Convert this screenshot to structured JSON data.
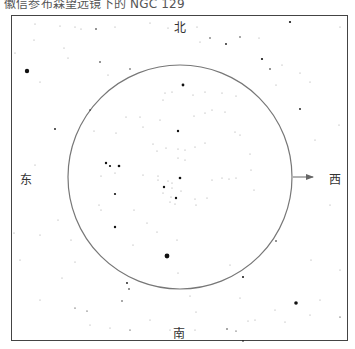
{
  "title": "徽信参布森望远镜下的 NGC 129",
  "directions": {
    "north": "北",
    "south": "南",
    "east": "东",
    "west": "西"
  },
  "field_circle": {
    "cx": 180,
    "cy": 177,
    "r": 112,
    "stroke": "#777777"
  },
  "motion_arrow": {
    "x1": 293,
    "y1": 177,
    "x2": 313,
    "y2": 177,
    "color": "#666666"
  },
  "colors": {
    "frame": "#444444",
    "star": "#111111",
    "faint_star": "#999999",
    "text": "#333333"
  },
  "stars": [
    {
      "x": 27,
      "y": 71,
      "r": 2.2
    },
    {
      "x": 183,
      "y": 85,
      "r": 1.4
    },
    {
      "x": 178,
      "y": 131,
      "r": 1.2
    },
    {
      "x": 106,
      "y": 163,
      "r": 1.2
    },
    {
      "x": 110,
      "y": 166,
      "r": 1.1
    },
    {
      "x": 119,
      "y": 166,
      "r": 1.3
    },
    {
      "x": 180,
      "y": 178,
      "r": 1.3
    },
    {
      "x": 164,
      "y": 187,
      "r": 1.2
    },
    {
      "x": 176,
      "y": 198,
      "r": 1.2
    },
    {
      "x": 115,
      "y": 194,
      "r": 1.1
    },
    {
      "x": 115,
      "y": 227,
      "r": 1.2
    },
    {
      "x": 167,
      "y": 256,
      "r": 2.4
    },
    {
      "x": 96,
      "y": 29,
      "r": 0.8
    },
    {
      "x": 290,
      "y": 22,
      "r": 1.1
    },
    {
      "x": 226,
      "y": 44,
      "r": 0.9
    },
    {
      "x": 262,
      "y": 59,
      "r": 1.1
    },
    {
      "x": 270,
      "y": 69,
      "r": 0.8
    },
    {
      "x": 300,
      "y": 109,
      "r": 0.9
    },
    {
      "x": 100,
      "y": 62,
      "r": 0.8
    },
    {
      "x": 55,
      "y": 129,
      "r": 0.9
    },
    {
      "x": 90,
      "y": 110,
      "r": 0.7
    },
    {
      "x": 130,
      "y": 69,
      "r": 0.7
    },
    {
      "x": 210,
      "y": 38,
      "r": 0.7
    },
    {
      "x": 240,
      "y": 37,
      "r": 0.7
    },
    {
      "x": 296,
      "y": 303,
      "r": 1.8
    },
    {
      "x": 243,
      "y": 277,
      "r": 1.0
    },
    {
      "x": 276,
      "y": 241,
      "r": 0.8
    },
    {
      "x": 127,
      "y": 283,
      "r": 0.9
    },
    {
      "x": 129,
      "y": 289,
      "r": 0.8
    },
    {
      "x": 122,
      "y": 301,
      "r": 0.7
    },
    {
      "x": 227,
      "y": 329,
      "r": 0.7
    },
    {
      "x": 243,
      "y": 341,
      "r": 0.8
    },
    {
      "x": 340,
      "y": 317,
      "r": 0.6
    },
    {
      "x": 75,
      "y": 308,
      "r": 0.6
    },
    {
      "x": 87,
      "y": 311,
      "r": 0.6
    },
    {
      "x": 236,
      "y": 331,
      "r": 0.6
    },
    {
      "x": 130,
      "y": 330,
      "r": 0.6
    }
  ],
  "faint_stars": [
    {
      "x": 35,
      "y": 24
    },
    {
      "x": 60,
      "y": 26
    },
    {
      "x": 75,
      "y": 27
    },
    {
      "x": 81,
      "y": 29
    },
    {
      "x": 115,
      "y": 27
    },
    {
      "x": 150,
      "y": 23
    },
    {
      "x": 168,
      "y": 28
    },
    {
      "x": 34,
      "y": 40
    },
    {
      "x": 15,
      "y": 53
    },
    {
      "x": 64,
      "y": 48
    },
    {
      "x": 68,
      "y": 58
    },
    {
      "x": 108,
      "y": 75
    },
    {
      "x": 40,
      "y": 82
    },
    {
      "x": 200,
      "y": 42
    },
    {
      "x": 197,
      "y": 27
    },
    {
      "x": 259,
      "y": 38
    },
    {
      "x": 282,
      "y": 65
    },
    {
      "x": 276,
      "y": 85
    },
    {
      "x": 300,
      "y": 73
    },
    {
      "x": 310,
      "y": 82
    },
    {
      "x": 340,
      "y": 27
    },
    {
      "x": 339,
      "y": 125
    },
    {
      "x": 315,
      "y": 140
    },
    {
      "x": 330,
      "y": 205
    },
    {
      "x": 311,
      "y": 260
    },
    {
      "x": 340,
      "y": 270
    },
    {
      "x": 320,
      "y": 300
    },
    {
      "x": 310,
      "y": 315
    },
    {
      "x": 275,
      "y": 310
    },
    {
      "x": 285,
      "y": 322
    },
    {
      "x": 40,
      "y": 235
    },
    {
      "x": 58,
      "y": 220
    },
    {
      "x": 71,
      "y": 240
    },
    {
      "x": 75,
      "y": 262
    },
    {
      "x": 62,
      "y": 278
    },
    {
      "x": 40,
      "y": 300
    },
    {
      "x": 90,
      "y": 325
    },
    {
      "x": 110,
      "y": 328
    },
    {
      "x": 150,
      "y": 320
    },
    {
      "x": 170,
      "y": 330
    },
    {
      "x": 240,
      "y": 298
    },
    {
      "x": 255,
      "y": 320
    },
    {
      "x": 195,
      "y": 330
    },
    {
      "x": 14,
      "y": 233
    },
    {
      "x": 22,
      "y": 180
    },
    {
      "x": 35,
      "y": 165
    },
    {
      "x": 20,
      "y": 260
    },
    {
      "x": 165,
      "y": 93
    },
    {
      "x": 172,
      "y": 92
    },
    {
      "x": 163,
      "y": 100
    },
    {
      "x": 193,
      "y": 95
    },
    {
      "x": 205,
      "y": 92
    },
    {
      "x": 222,
      "y": 93
    },
    {
      "x": 236,
      "y": 96
    },
    {
      "x": 212,
      "y": 110
    },
    {
      "x": 205,
      "y": 113
    },
    {
      "x": 225,
      "y": 112
    },
    {
      "x": 194,
      "y": 116
    },
    {
      "x": 126,
      "y": 117
    },
    {
      "x": 140,
      "y": 117
    },
    {
      "x": 143,
      "y": 127
    },
    {
      "x": 160,
      "y": 120
    },
    {
      "x": 94,
      "y": 131
    },
    {
      "x": 116,
      "y": 133
    },
    {
      "x": 235,
      "y": 132
    },
    {
      "x": 240,
      "y": 135
    },
    {
      "x": 153,
      "y": 144
    },
    {
      "x": 157,
      "y": 151
    },
    {
      "x": 166,
      "y": 148
    },
    {
      "x": 178,
      "y": 149
    },
    {
      "x": 185,
      "y": 150
    },
    {
      "x": 195,
      "y": 147
    },
    {
      "x": 205,
      "y": 143
    },
    {
      "x": 178,
      "y": 158
    },
    {
      "x": 185,
      "y": 160
    },
    {
      "x": 143,
      "y": 175
    },
    {
      "x": 158,
      "y": 176
    },
    {
      "x": 158,
      "y": 180
    },
    {
      "x": 168,
      "y": 181
    },
    {
      "x": 172,
      "y": 183
    },
    {
      "x": 172,
      "y": 188
    },
    {
      "x": 163,
      "y": 193
    },
    {
      "x": 171,
      "y": 197
    },
    {
      "x": 181,
      "y": 191
    },
    {
      "x": 170,
      "y": 202
    },
    {
      "x": 175,
      "y": 204
    },
    {
      "x": 195,
      "y": 199
    },
    {
      "x": 196,
      "y": 205
    },
    {
      "x": 207,
      "y": 198
    },
    {
      "x": 212,
      "y": 180
    },
    {
      "x": 222,
      "y": 178
    },
    {
      "x": 229,
      "y": 179
    },
    {
      "x": 236,
      "y": 178
    },
    {
      "x": 251,
      "y": 170
    },
    {
      "x": 254,
      "y": 190
    },
    {
      "x": 250,
      "y": 154
    },
    {
      "x": 101,
      "y": 176
    },
    {
      "x": 115,
      "y": 173
    },
    {
      "x": 99,
      "y": 205
    },
    {
      "x": 101,
      "y": 210
    },
    {
      "x": 134,
      "y": 210
    },
    {
      "x": 147,
      "y": 223
    },
    {
      "x": 157,
      "y": 232
    },
    {
      "x": 133,
      "y": 245
    },
    {
      "x": 177,
      "y": 240
    },
    {
      "x": 230,
      "y": 265
    },
    {
      "x": 178,
      "y": 273
    },
    {
      "x": 190,
      "y": 296
    },
    {
      "x": 196,
      "y": 312
    },
    {
      "x": 248,
      "y": 321
    }
  ]
}
